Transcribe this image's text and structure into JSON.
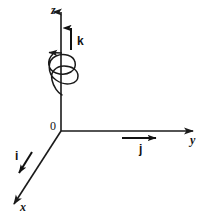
{
  "figure": {
    "background_color": "#ffffff",
    "stroke_color": "#1a1a1a",
    "width": 204,
    "height": 219
  },
  "axes": [
    {
      "id": "z",
      "label": "z",
      "direction": "up",
      "from": [
        61,
        131
      ],
      "to": [
        61,
        10
      ],
      "arrow": "up"
    },
    {
      "id": "y",
      "label": "y",
      "direction": "right",
      "from": [
        61,
        131
      ],
      "to": [
        195,
        131
      ],
      "arrow": "right"
    },
    {
      "id": "x",
      "label": "x",
      "direction": "down-left",
      "from": [
        61,
        131
      ],
      "to": [
        12,
        207
      ],
      "arrow": "down-left"
    }
  ],
  "origin": {
    "label": "0",
    "position": [
      61,
      131
    ]
  },
  "unit_vectors": [
    {
      "id": "k",
      "label": "k",
      "along_axis": "z",
      "from": [
        71,
        50
      ],
      "to": [
        71,
        26
      ]
    },
    {
      "id": "j",
      "label": "j",
      "along_axis": "y",
      "from": [
        122,
        138
      ],
      "to": [
        160,
        138
      ]
    },
    {
      "id": "i",
      "label": "i",
      "along_axis": "x",
      "from": [
        32,
        152
      ],
      "to": [
        17,
        177
      ]
    }
  ],
  "rotation_indicator": {
    "id": "helix",
    "description": "counter-clockwise-helix-around-z-axis",
    "turns": 2,
    "center_x": 61,
    "top_y": 53,
    "bottom_y": 95,
    "radius_x": 14,
    "radius_y": 9,
    "arrow_direction": "left"
  }
}
